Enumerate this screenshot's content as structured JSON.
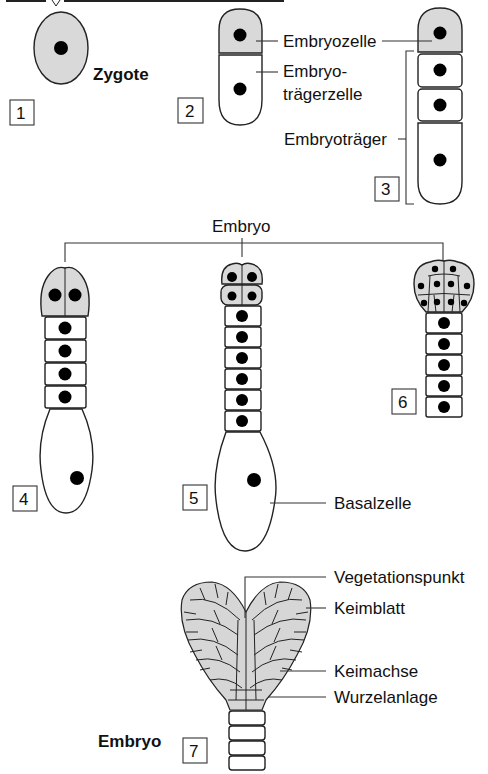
{
  "figure": {
    "title_cropped": "",
    "colors": {
      "embryo_cell_fill": "#d9d9d9",
      "suspensor_cell_fill": "#ffffff",
      "nucleus": "#000000",
      "outline": "#222222"
    }
  },
  "stages": [
    {
      "number": "1",
      "label": "Zygote"
    },
    {
      "number": "2",
      "labels": [
        "Embryozelle",
        "Embryo-",
        "trägerzelle"
      ]
    },
    {
      "number": "3",
      "labels": [
        "Embryoträger"
      ]
    },
    {
      "number": "4"
    },
    {
      "number": "5",
      "labels": [
        "Basalzelle"
      ]
    },
    {
      "number": "6"
    },
    {
      "number": "7",
      "label": "Embryo"
    }
  ],
  "labels": {
    "zygote": "Zygote",
    "embryozelle": "Embryozelle",
    "embryotraegerzelle_line1": "Embryo-",
    "embryotraegerzelle_line2": "trägerzelle",
    "embryotraeger": "Embryoträger",
    "embryo_bracket": "Embryo",
    "basalzelle": "Basalzelle",
    "vegetationspunkt": "Vegetationspunkt",
    "keimblatt": "Keimblatt",
    "keimachse": "Keimachse",
    "wurzelanlage": "Wurzelanlage",
    "embryo_final": "Embryo"
  },
  "step_numbers": [
    "1",
    "2",
    "3",
    "4",
    "5",
    "6",
    "7"
  ]
}
